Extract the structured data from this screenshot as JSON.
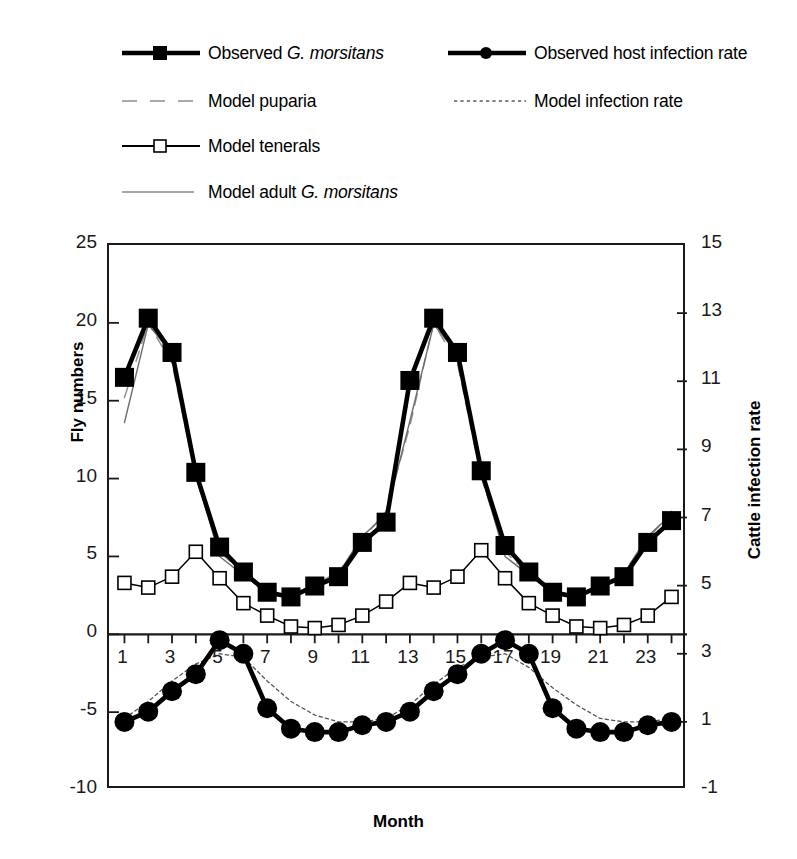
{
  "legend": {
    "items": [
      {
        "label_prefix": "Observed ",
        "label_italic": "G. morsitans",
        "label_suffix": "",
        "key": "thick-line-filled-square",
        "name": "legend-observed-g-morsitans"
      },
      {
        "label_prefix": "Observed host infection rate",
        "label_italic": "",
        "label_suffix": "",
        "key": "thick-line-filled-circle",
        "name": "legend-observed-host-infection-rate"
      },
      {
        "label_prefix": "Model puparia",
        "label_italic": "",
        "label_suffix": "",
        "key": "dashed-gray-line",
        "name": "legend-model-puparia"
      },
      {
        "label_prefix": "Model infection rate",
        "label_italic": "",
        "label_suffix": "",
        "key": "dotted-line",
        "name": "legend-model-infection-rate"
      },
      {
        "label_prefix": "Model tenerals",
        "label_italic": "",
        "label_suffix": "",
        "key": "thin-line-open-square",
        "name": "legend-model-tenerals"
      },
      {
        "label_prefix": "Model adult ",
        "label_italic": "G. morsitans",
        "label_suffix": "",
        "key": "thin-gray-line",
        "name": "legend-model-adult-g-morsitans"
      }
    ]
  },
  "chart_data": {
    "type": "line",
    "title": "",
    "xlabel": "Month",
    "ylabel": "Fly numbers",
    "y2label": "Cattle infection rate",
    "grid": false,
    "legend_position": "top",
    "x": [
      1,
      2,
      3,
      4,
      5,
      6,
      7,
      8,
      9,
      10,
      11,
      12,
      13,
      14,
      15,
      16,
      17,
      18,
      19,
      20,
      21,
      22,
      23,
      24
    ],
    "xtick_labels": [
      "1",
      "3",
      "5",
      "7",
      "9",
      "11",
      "13",
      "15",
      "17",
      "19",
      "21",
      "23"
    ],
    "xtick_values": [
      1,
      3,
      5,
      7,
      9,
      11,
      13,
      15,
      17,
      19,
      21,
      23
    ],
    "ylim": [
      -10,
      25
    ],
    "ytick_labels": [
      "-10",
      "-5",
      "0",
      "5",
      "10",
      "15",
      "20",
      "25"
    ],
    "ytick_values": [
      -10,
      -5,
      0,
      5,
      10,
      15,
      20,
      25
    ],
    "y2lim": [
      -1,
      15
    ],
    "y2tick_labels": [
      "-1",
      "1",
      "3",
      "5",
      "7",
      "9",
      "11",
      "13",
      "15"
    ],
    "y2tick_values": [
      -1,
      1,
      3,
      5,
      7,
      9,
      11,
      13,
      15
    ],
    "series": [
      {
        "name": "Observed G. morsitans",
        "axis": "left",
        "style": "thick-line-filled-square",
        "values": [
          16.5,
          20.3,
          18.1,
          10.4,
          5.6,
          4.0,
          2.7,
          2.4,
          3.1,
          3.7,
          5.9,
          7.2,
          16.3,
          20.3,
          18.1,
          10.5,
          5.7,
          4.0,
          2.7,
          2.4,
          3.1,
          3.7,
          5.9,
          7.3
        ]
      },
      {
        "name": "Model adult G. morsitans",
        "axis": "left",
        "style": "thin-gray-line",
        "values": [
          13.6,
          19.9,
          18.0,
          10.3,
          5.0,
          3.8,
          2.7,
          2.5,
          3.1,
          3.9,
          6.3,
          7.7,
          13.7,
          19.9,
          18.0,
          10.3,
          5.0,
          3.8,
          2.7,
          2.5,
          3.1,
          3.9,
          6.3,
          7.7
        ]
      },
      {
        "name": "Model puparia",
        "axis": "left",
        "style": "dashed-gray-line",
        "values": [
          15.2,
          20.0,
          17.4,
          10.1,
          5.3,
          3.9,
          2.8,
          2.5,
          3.2,
          4.0,
          6.1,
          7.9,
          13.4,
          20.0,
          17.4,
          10.1,
          5.3,
          3.9,
          2.8,
          2.5,
          3.2,
          4.0,
          6.1,
          7.9
        ]
      },
      {
        "name": "Model tenerals",
        "axis": "left",
        "style": "thin-line-open-square",
        "values": [
          3.3,
          3.0,
          3.7,
          5.3,
          3.6,
          2.0,
          1.2,
          0.5,
          0.4,
          0.6,
          1.2,
          2.1,
          3.3,
          3.0,
          3.7,
          5.4,
          3.6,
          2.0,
          1.2,
          0.5,
          0.4,
          0.6,
          1.2,
          2.4
        ]
      },
      {
        "name": "Observed host infection rate",
        "axis": "right",
        "style": "thick-line-filled-circle",
        "values": [
          1.0,
          1.3,
          1.9,
          2.4,
          3.4,
          3.0,
          1.4,
          0.8,
          0.7,
          0.7,
          0.9,
          1.0,
          1.3,
          1.9,
          2.4,
          3.0,
          3.4,
          3.0,
          1.4,
          0.8,
          0.7,
          0.7,
          0.9,
          1.0
        ]
      },
      {
        "name": "Model infection rate",
        "axis": "right",
        "style": "dotted-line",
        "values": [
          1.1,
          1.6,
          2.2,
          2.7,
          3.0,
          2.9,
          2.2,
          1.6,
          1.2,
          1.0,
          1.0,
          1.1,
          1.5,
          2.1,
          2.6,
          2.9,
          3.0,
          2.6,
          2.0,
          1.5,
          1.1,
          1.0,
          1.0,
          1.1
        ]
      }
    ]
  }
}
